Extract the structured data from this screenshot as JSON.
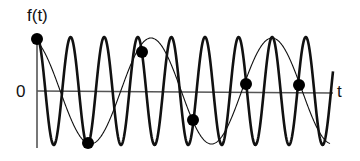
{
  "diagram": {
    "labels": {
      "y_axis": "f(t)",
      "origin": "0",
      "x_axis": "t"
    },
    "colors": {
      "background": "#ffffff",
      "stroke": "#111111",
      "axis": "#555555",
      "sample_point": "#000000"
    },
    "axes": {
      "origin": [
        37,
        91
      ],
      "x_end": [
        333,
        93
      ],
      "y_top": 39,
      "y_bottom": 148
    },
    "high_frequency_signal": {
      "name": "original signal",
      "center_y": 91,
      "amplitude_px": 54,
      "period_px": 33.6,
      "phase_peak_x": 37,
      "x_start": 37,
      "x_end": 333,
      "stroke_width": 2.6
    },
    "alias_signal": {
      "name": "aliased reconstruction",
      "center_y": 91,
      "amplitude_px": 53,
      "period_px": 121,
      "phase_peak_x": 30,
      "x_start": 37,
      "x_end": 330,
      "stroke_width": 1.1
    },
    "sample_points": [
      {
        "x": 37,
        "y": 39
      },
      {
        "x": 88,
        "y": 143
      },
      {
        "x": 142,
        "y": 52
      },
      {
        "x": 193,
        "y": 120
      },
      {
        "x": 246,
        "y": 84
      },
      {
        "x": 299,
        "y": 85
      }
    ],
    "sample_point_radius": 6
  }
}
